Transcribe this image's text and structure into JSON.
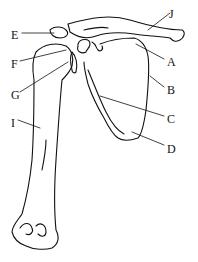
{
  "diagram": {
    "labels": [
      {
        "id": "A",
        "text": "A",
        "x": 167,
        "y": 56
      },
      {
        "id": "B",
        "text": "B",
        "x": 167,
        "y": 84
      },
      {
        "id": "C",
        "text": "C",
        "x": 167,
        "y": 113
      },
      {
        "id": "D",
        "text": "D",
        "x": 167,
        "y": 143
      },
      {
        "id": "E",
        "text": "E",
        "x": 11,
        "y": 29
      },
      {
        "id": "F",
        "text": "F",
        "x": 11,
        "y": 58
      },
      {
        "id": "G",
        "text": "G",
        "x": 11,
        "y": 89
      },
      {
        "id": "I",
        "text": "I",
        "x": 11,
        "y": 117
      },
      {
        "id": "J",
        "text": "J",
        "x": 169,
        "y": 8
      }
    ],
    "colors": {
      "line": "#111111",
      "background": "#ffffff"
    }
  }
}
